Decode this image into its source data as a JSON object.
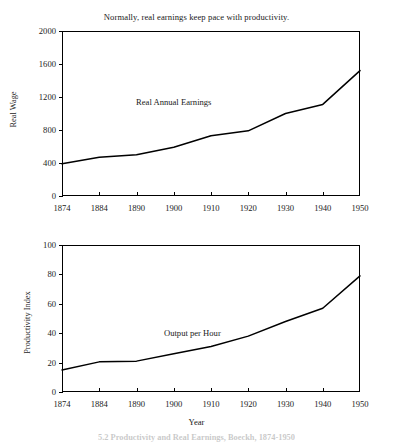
{
  "figure": {
    "caption": "5.2   Productivity and Real Earnings, Boeckh, 1874-1950"
  },
  "chart_data": [
    {
      "type": "line",
      "title": "Normally, real earnings keep pace with productivity.",
      "xlabel": "",
      "ylabel": "Real Wage",
      "ylim": [
        0,
        2000
      ],
      "yticks": [
        0,
        400,
        800,
        1200,
        1600,
        2000
      ],
      "categories": [
        "1874",
        "1884",
        "1890",
        "1900",
        "1910",
        "1920",
        "1930",
        "1940",
        "1950"
      ],
      "grid": false,
      "legend": "none",
      "series": [
        {
          "name": "Real Annual Earnings",
          "label_x": "1900",
          "label_y": 1140,
          "values": [
            390,
            470,
            500,
            590,
            730,
            790,
            1000,
            1110,
            1520
          ]
        }
      ]
    },
    {
      "type": "line",
      "title": "",
      "xlabel": "Year",
      "ylabel": "Productivity Index",
      "ylim": [
        0,
        100
      ],
      "yticks": [
        0,
        20,
        40,
        60,
        80,
        100
      ],
      "categories": [
        "1874",
        "1884",
        "1890",
        "1900",
        "1910",
        "1920",
        "1930",
        "1940",
        "1950"
      ],
      "grid": false,
      "legend": "none",
      "series": [
        {
          "name": "Output per Hour",
          "label_x": "1905",
          "label_y": 40,
          "values": [
            15,
            20.5,
            21,
            26,
            31,
            38,
            48,
            57,
            79
          ]
        }
      ]
    }
  ]
}
